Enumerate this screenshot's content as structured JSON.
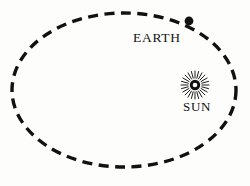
{
  "diagram": {
    "background_color": "#fdfdfc",
    "ink_color": "#111111",
    "labels": {
      "earth": "EARTH",
      "sun": "SUN"
    },
    "icons": {
      "earth": "filled-dot-icon",
      "sun": "sun-starburst-icon",
      "orbit": "dashed-ellipse-icon"
    },
    "orbit": {
      "center_x": 124,
      "center_y": 90,
      "radius_x": 112,
      "radius_y": 77,
      "stroke_width": 3.4,
      "dash_length": 10,
      "dash_gap": 6.5,
      "style": "dashed"
    },
    "earth_marker": {
      "x": 189,
      "y": 21,
      "radius": 4.4
    },
    "sun_marker": {
      "x": 195,
      "y": 85,
      "outer_ring_radius": 5.2,
      "inner_hole_radius": 2.3,
      "ray_count": 24,
      "ray_inner_radius": 7,
      "ray_outer_radius": 14
    }
  }
}
